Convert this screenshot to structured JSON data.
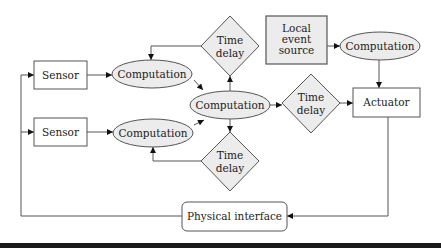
{
  "diagram": {
    "type": "block-flow",
    "nodes": {
      "sensor_1": {
        "label": "Sensor",
        "shape": "rectangle"
      },
      "sensor_2": {
        "label": "Sensor",
        "shape": "rectangle"
      },
      "computation_1": {
        "label": "Computation",
        "shape": "ellipse"
      },
      "computation_2": {
        "label": "Computation",
        "shape": "ellipse"
      },
      "computation_center": {
        "label": "Computation",
        "shape": "ellipse"
      },
      "computation_right": {
        "label": "Computation",
        "shape": "ellipse"
      },
      "time_delay_top": {
        "line1": "Time",
        "line2": "delay",
        "shape": "diamond"
      },
      "time_delay_bottom": {
        "line1": "Time",
        "line2": "delay",
        "shape": "diamond"
      },
      "time_delay_right": {
        "line1": "Time",
        "line2": "delay",
        "shape": "diamond"
      },
      "local_event_source": {
        "line1": "Local",
        "line2": "event",
        "line3": "source",
        "shape": "shaded-rectangle"
      },
      "actuator": {
        "label": "Actuator",
        "shape": "rectangle"
      },
      "physical_interface": {
        "label": "Physical interface",
        "shape": "rounded-rectangle"
      }
    },
    "edges": [
      {
        "from": "physical_interface",
        "to": "sensor_1"
      },
      {
        "from": "physical_interface",
        "to": "sensor_2"
      },
      {
        "from": "sensor_1",
        "to": "computation_1"
      },
      {
        "from": "sensor_2",
        "to": "computation_2"
      },
      {
        "from": "computation_1",
        "to": "computation_center"
      },
      {
        "from": "computation_2",
        "to": "computation_center"
      },
      {
        "from": "computation_center",
        "to": "time_delay_top"
      },
      {
        "from": "time_delay_top",
        "to": "computation_1"
      },
      {
        "from": "computation_center",
        "to": "time_delay_bottom"
      },
      {
        "from": "time_delay_bottom",
        "to": "computation_2"
      },
      {
        "from": "computation_center",
        "to": "time_delay_right"
      },
      {
        "from": "time_delay_right",
        "to": "actuator"
      },
      {
        "from": "local_event_source",
        "to": "computation_right"
      },
      {
        "from": "computation_right",
        "to": "actuator"
      },
      {
        "from": "actuator",
        "to": "physical_interface"
      }
    ],
    "colors": {
      "node_fill": "#ececec",
      "stroke": "#555555",
      "background": "#ffffff"
    }
  }
}
